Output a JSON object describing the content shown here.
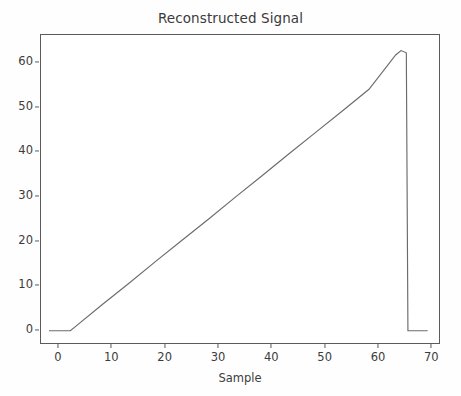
{
  "chart_data": {
    "type": "line",
    "title": "Reconstructed Signal",
    "xlabel": "Sample",
    "ylabel": "",
    "xlim": [
      -1.5,
      73.5
    ],
    "ylim": [
      -3.2,
      66.5
    ],
    "grid": false,
    "legend": null,
    "line_color": "#6b6b6b",
    "xticks": [
      0,
      10,
      20,
      30,
      40,
      50,
      60,
      70
    ],
    "xtick_labels": [
      "0",
      "10",
      "20",
      "30",
      "40",
      "50",
      "60",
      "70"
    ],
    "yticks": [
      0,
      10,
      20,
      30,
      40,
      50,
      60
    ],
    "ytick_labels": [
      "0",
      "10",
      "20",
      "30",
      "40",
      "50",
      "60"
    ],
    "series": [
      {
        "name": "reconstructed",
        "x": [
          0,
          1,
          2,
          3,
          4,
          5,
          10,
          15,
          20,
          25,
          30,
          35,
          40,
          45,
          50,
          55,
          60,
          65,
          66,
          67,
          67.3,
          68,
          69,
          70,
          71
        ],
        "y": [
          0,
          0,
          0,
          0,
          0,
          1,
          5.9,
          10.7,
          15.6,
          20.4,
          25.2,
          30.1,
          34.9,
          39.8,
          44.6,
          49.4,
          54.3,
          62.0,
          63.0,
          62.5,
          0,
          0,
          0,
          0,
          0
        ]
      }
    ],
    "annotations": {
      "peak_value": 63,
      "peak_sample": 66,
      "flat_start_sample": 4,
      "drop_sample": 67,
      "tail_end_sample": 71
    }
  },
  "figure": {
    "background_color": "#fefefe",
    "axes_color": "#5b5b5b",
    "text_color": "#3c3c3c"
  }
}
